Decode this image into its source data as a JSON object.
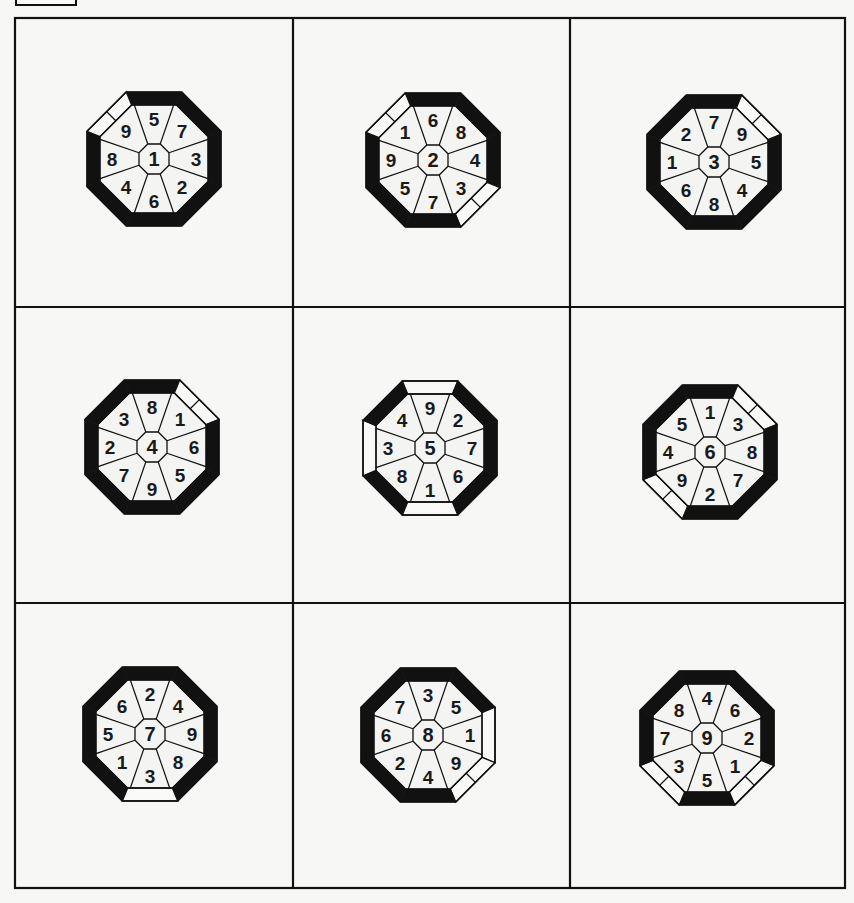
{
  "colors": {
    "background": "#f7f7f5",
    "ink": "#111111",
    "region_fill": "#f4f4f2",
    "white_side": "#f9f9f7"
  },
  "grid": {
    "x": [
      15,
      293,
      570,
      845
    ],
    "y": [
      18,
      307,
      603,
      888
    ]
  },
  "octagon": {
    "outer_half": 67,
    "ring": 13,
    "center_half": 15
  },
  "sides_order": [
    "N",
    "NE",
    "E",
    "SE",
    "S",
    "SW",
    "W",
    "NW"
  ],
  "cells": [
    {
      "center": "1",
      "cx": 154,
      "cy": 159,
      "labels": {
        "N": "5",
        "NE": "7",
        "E": "3",
        "SE": "2",
        "S": "6",
        "SW": "4",
        "W": "8",
        "NW": "9"
      },
      "border": {
        "N": "black",
        "NE": "black",
        "E": "black",
        "SE": "black",
        "S": "black",
        "SW": "black",
        "W": "black",
        "NW": "white-split"
      }
    },
    {
      "center": "2",
      "cx": 433,
      "cy": 160,
      "labels": {
        "N": "6",
        "NE": "8",
        "E": "4",
        "SE": "3",
        "S": "7",
        "SW": "5",
        "W": "9",
        "NW": "1"
      },
      "border": {
        "N": "black",
        "NE": "black",
        "E": "black",
        "SE": "white-split",
        "S": "black",
        "SW": "black",
        "W": "black",
        "NW": "white-split"
      }
    },
    {
      "center": "3",
      "cx": 714,
      "cy": 162,
      "labels": {
        "N": "7",
        "NE": "9",
        "E": "5",
        "SE": "4",
        "S": "8",
        "SW": "6",
        "W": "1",
        "NW": "2"
      },
      "border": {
        "N": "black",
        "NE": "white-split",
        "E": "black",
        "SE": "black",
        "S": "black",
        "SW": "black",
        "W": "black",
        "NW": "black"
      }
    },
    {
      "center": "4",
      "cx": 152,
      "cy": 447,
      "labels": {
        "N": "8",
        "NE": "1",
        "E": "6",
        "SE": "5",
        "S": "9",
        "SW": "7",
        "W": "2",
        "NW": "3"
      },
      "border": {
        "N": "black",
        "NE": "white-split",
        "E": "black",
        "SE": "black",
        "S": "black",
        "SW": "black",
        "W": "black",
        "NW": "black"
      }
    },
    {
      "center": "5",
      "cx": 430,
      "cy": 448,
      "labels": {
        "N": "9",
        "NE": "2",
        "E": "7",
        "SE": "6",
        "S": "1",
        "SW": "8",
        "W": "3",
        "NW": "4"
      },
      "border": {
        "N": "white",
        "NE": "black",
        "E": "black",
        "SE": "black",
        "S": "white",
        "SW": "black",
        "W": "white",
        "NW": "black"
      }
    },
    {
      "center": "6",
      "cx": 710,
      "cy": 452,
      "labels": {
        "N": "1",
        "NE": "3",
        "E": "8",
        "SE": "7",
        "S": "2",
        "SW": "9",
        "W": "4",
        "NW": "5"
      },
      "border": {
        "N": "black",
        "NE": "white-split",
        "E": "black",
        "SE": "black",
        "S": "black",
        "SW": "white-split",
        "W": "black",
        "NW": "black"
      }
    },
    {
      "center": "7",
      "cx": 150,
      "cy": 734,
      "labels": {
        "N": "2",
        "NE": "4",
        "E": "9",
        "SE": "8",
        "S": "3",
        "SW": "1",
        "W": "5",
        "NW": "6"
      },
      "border": {
        "N": "black",
        "NE": "black",
        "E": "black",
        "SE": "black",
        "S": "white",
        "SW": "black",
        "W": "black",
        "NW": "black"
      }
    },
    {
      "center": "8",
      "cx": 428,
      "cy": 735,
      "labels": {
        "N": "3",
        "NE": "5",
        "E": "1",
        "SE": "9",
        "S": "4",
        "SW": "2",
        "W": "6",
        "NW": "7"
      },
      "border": {
        "N": "black",
        "NE": "black",
        "E": "white",
        "SE": "white-split",
        "S": "black",
        "SW": "black",
        "W": "black",
        "NW": "black"
      }
    },
    {
      "center": "9",
      "cx": 707,
      "cy": 738,
      "labels": {
        "N": "4",
        "NE": "6",
        "E": "2",
        "SE": "1",
        "S": "5",
        "SW": "3",
        "W": "7",
        "NW": "8"
      },
      "border": {
        "N": "black",
        "NE": "black",
        "E": "black",
        "SE": "white-split",
        "S": "black",
        "SW": "white-split",
        "W": "black",
        "NW": "black"
      }
    }
  ]
}
